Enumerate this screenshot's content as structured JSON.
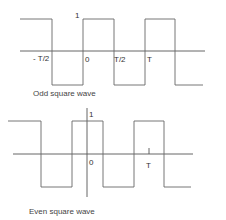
{
  "diagrams": [
    {
      "caption": "Odd square wave",
      "amplitude_label": "1",
      "x_labels": [
        "- T/2",
        "0",
        "T/2",
        "T"
      ],
      "wave": "odd"
    },
    {
      "caption": "Even square wave",
      "amplitude_label": "1",
      "x_labels": [
        "0",
        "T"
      ],
      "wave": "even"
    }
  ],
  "colors": {
    "line": "#555555",
    "text": "#333333",
    "background": "#ffffff"
  }
}
